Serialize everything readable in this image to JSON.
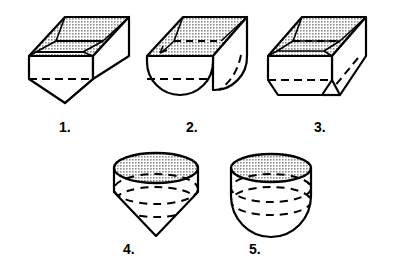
{
  "diagram": {
    "background_color": "#ffffff",
    "line_color": "#000000",
    "interior_fill_color": "#c8c8c8",
    "hidden_line_style": "dashed",
    "figures": [
      {
        "number": "1.",
        "name": "rectangular-box-with-v-wedge-bottom",
        "description": "Open rectangular box with V-shaped wedge bottom",
        "top_shape": "rectangle",
        "bottom_shape": "wedge"
      },
      {
        "number": "2.",
        "name": "rectangular-box-with-semicylindrical-bottom",
        "description": "Open rectangular box with rounded half-cylinder bottom",
        "top_shape": "rectangle",
        "bottom_shape": "half-cylinder"
      },
      {
        "number": "3.",
        "name": "rectangular-box-with-truncated-wedge-bottom",
        "description": "Open rectangular box with flat truncated trapezoidal bottom",
        "top_shape": "rectangle",
        "bottom_shape": "truncated-wedge"
      },
      {
        "number": "4.",
        "name": "cylinder-with-conical-bottom",
        "description": "Open cylinder with pointed cone bottom",
        "top_shape": "circle",
        "bottom_shape": "cone"
      },
      {
        "number": "5.",
        "name": "cylinder-with-hemispherical-bottom",
        "description": "Open cylinder with rounded hemispherical bottom",
        "top_shape": "circle",
        "bottom_shape": "hemisphere"
      }
    ],
    "labels": {
      "fig1": "1.",
      "fig2": "2.",
      "fig3": "3.",
      "fig4": "4.",
      "fig5": "5."
    }
  }
}
